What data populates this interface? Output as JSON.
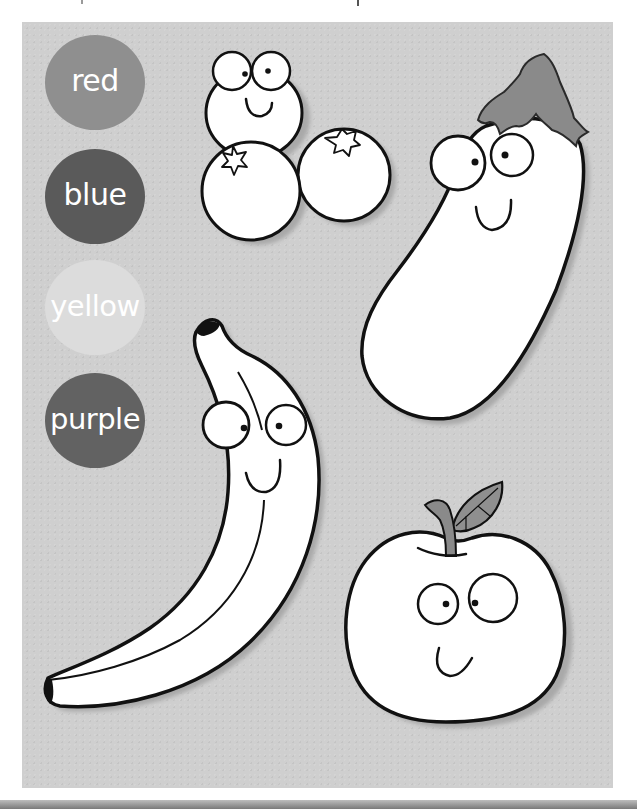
{
  "worksheet": {
    "color_options": [
      {
        "label": "red",
        "fill": "#8f8f8f"
      },
      {
        "label": "blue",
        "fill": "#5a5a5a"
      },
      {
        "label": "yellow",
        "fill": "#dcdcdc"
      },
      {
        "label": "purple",
        "fill": "#626262"
      }
    ],
    "fruits": [
      {
        "name": "blueberries",
        "count": 3
      },
      {
        "name": "eggplant"
      },
      {
        "name": "banana"
      },
      {
        "name": "apple"
      }
    ],
    "colors": {
      "panel_background": "#cfcfcf",
      "page_background": "#ffffff",
      "outline": "#111111",
      "fruit_fill": "#ffffff",
      "accent_grey": "#8a8a8a",
      "shadow": "#a9a9a9"
    }
  }
}
